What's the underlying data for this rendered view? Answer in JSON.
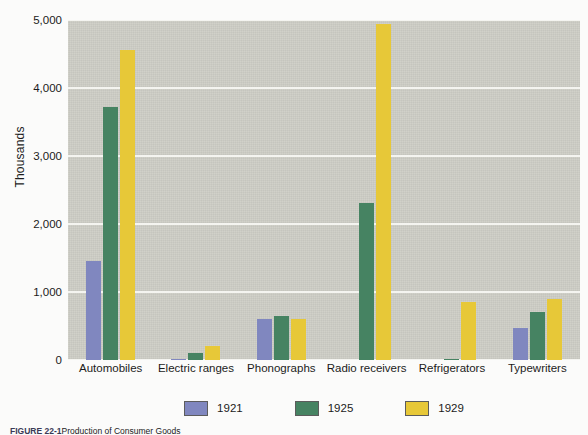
{
  "chart_data": {
    "type": "bar",
    "title": "",
    "xlabel": "",
    "ylabel": "Thousands",
    "ylim": [
      0,
      5000
    ],
    "yticks": [
      0,
      1000,
      2000,
      3000,
      4000,
      5000
    ],
    "ytick_labels": [
      "0",
      "1,000",
      "2,000",
      "3,000",
      "4,000",
      "5,000"
    ],
    "grid": true,
    "legend_position": "bottom",
    "categories": [
      "Automobiles",
      "Electric ranges",
      "Phonographs",
      "Radio receivers",
      "Refrigerators",
      "Typewriters"
    ],
    "series": [
      {
        "name": "1921",
        "color": "#8087bf",
        "values": [
          1460,
          20,
          600,
          0,
          0,
          470
        ]
      },
      {
        "name": "1925",
        "color": "#468362",
        "values": [
          3720,
          110,
          640,
          2310,
          10,
          710
        ]
      },
      {
        "name": "1929",
        "color": "#e7c838",
        "values": [
          4560,
          200,
          600,
          4940,
          850,
          900
        ]
      }
    ]
  },
  "axis": {
    "ylabel": "Thousands"
  },
  "legend": {
    "items": [
      {
        "label": "1921"
      },
      {
        "label": "1925"
      },
      {
        "label": "1929"
      }
    ]
  },
  "caption": {
    "figure_number": "FIGURE 22-1",
    "text": "Production of Consumer Goods"
  },
  "colors": {
    "plot_background": "#cdcdc5",
    "page_background": "#fbfbfa",
    "gridline": "#f4f4f0",
    "series_1921": "#8087bf",
    "series_1925": "#468362",
    "series_1929": "#e7c838"
  }
}
